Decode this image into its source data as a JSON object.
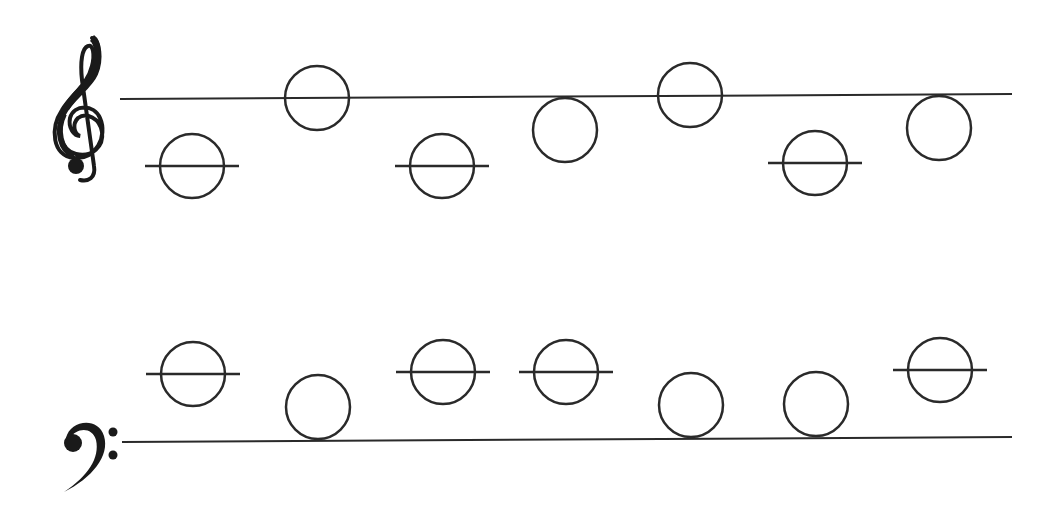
{
  "colors": {
    "ink": "#2a2a2a",
    "background": "#ffffff"
  },
  "treble": {
    "clef": "treble-clef",
    "staff_line": {
      "x1": 120,
      "y1": 99,
      "x2": 1012,
      "y2": 94
    },
    "notes": [
      {
        "cx": 192,
        "cy": 166,
        "ledger": true
      },
      {
        "cx": 317,
        "cy": 98,
        "ledger": false
      },
      {
        "cx": 442,
        "cy": 166,
        "ledger": true
      },
      {
        "cx": 565,
        "cy": 130,
        "ledger": false
      },
      {
        "cx": 690,
        "cy": 95,
        "ledger": false
      },
      {
        "cx": 815,
        "cy": 163,
        "ledger": true
      },
      {
        "cx": 939,
        "cy": 128,
        "ledger": false
      }
    ]
  },
  "bass": {
    "clef": "bass-clef",
    "staff_line": {
      "x1": 122,
      "y1": 442,
      "x2": 1012,
      "y2": 437
    },
    "notes": [
      {
        "cx": 193,
        "cy": 374,
        "ledger": true
      },
      {
        "cx": 318,
        "cy": 407,
        "ledger": false
      },
      {
        "cx": 443,
        "cy": 372,
        "ledger": true
      },
      {
        "cx": 566,
        "cy": 372,
        "ledger": true
      },
      {
        "cx": 691,
        "cy": 405,
        "ledger": false
      },
      {
        "cx": 816,
        "cy": 404,
        "ledger": false
      },
      {
        "cx": 940,
        "cy": 370,
        "ledger": true
      }
    ]
  },
  "note_radius": 32,
  "ledger_half_width": 47
}
